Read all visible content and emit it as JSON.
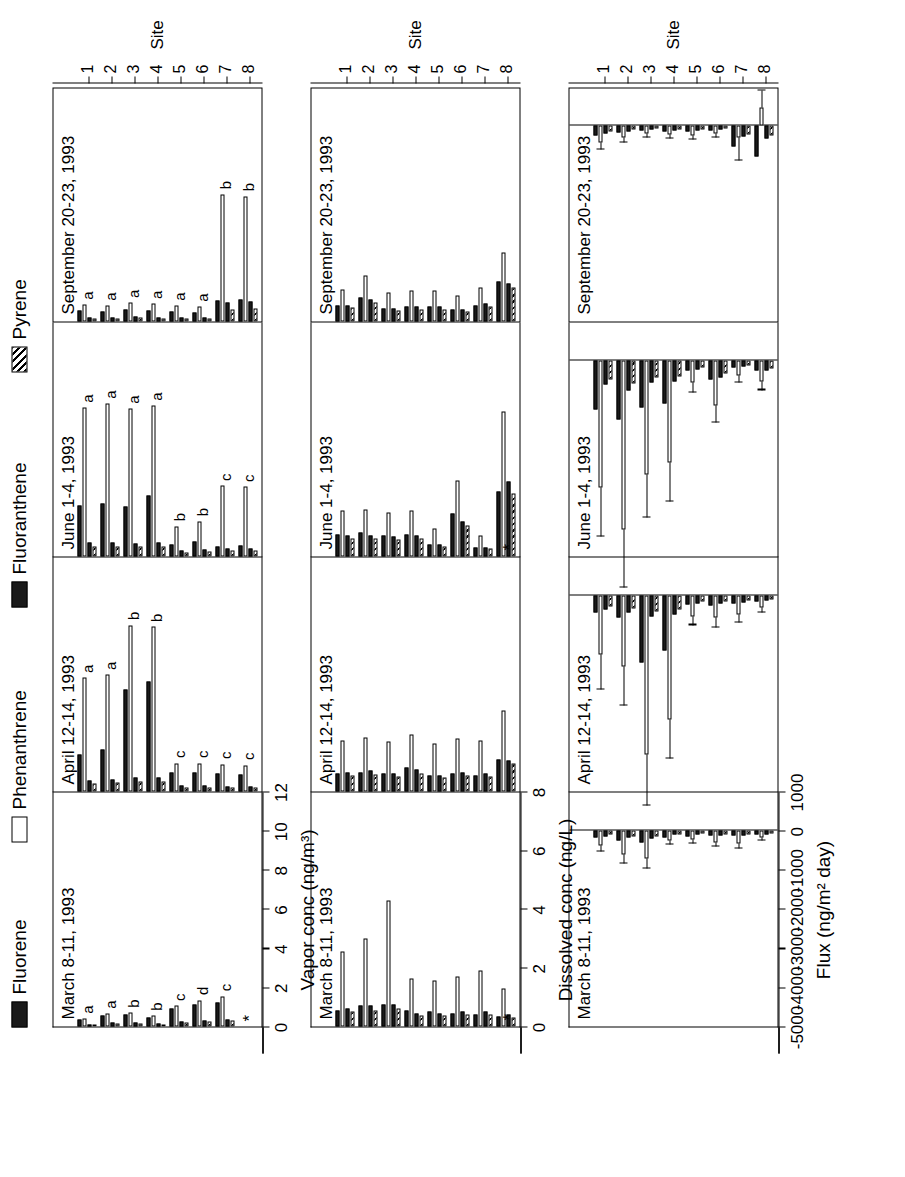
{
  "legend": {
    "items": [
      {
        "label": "Fluorene",
        "swatch": "solid-black"
      },
      {
        "label": "Phenanthrene",
        "swatch": "open-white"
      },
      {
        "label": "Fluoranthene",
        "swatch": "solid-black"
      },
      {
        "label": "Pyrene",
        "swatch": "hatched"
      }
    ]
  },
  "panels": [
    {
      "title": "March 8-11, 1993"
    },
    {
      "title": "April 12-14, 1993"
    },
    {
      "title": "June 1-4, 1993"
    },
    {
      "title": "September 20-23, 1993"
    }
  ],
  "site_axis": {
    "title": "Site",
    "ticks": [
      "1",
      "2",
      "3",
      "4",
      "5",
      "6",
      "7",
      "8"
    ]
  },
  "rows": [
    {
      "id": "vapor",
      "ylabel": "Vapor conc (ng/m³)",
      "yticks": [
        "0",
        "2",
        "4",
        "6",
        "8",
        "10",
        "12"
      ],
      "ymin": 0,
      "ymax": 12
    },
    {
      "id": "dissolved",
      "ylabel": "Dissolved conc (ng/L)",
      "yticks": [
        "0",
        "2",
        "4",
        "6",
        "8"
      ],
      "ymin": 0,
      "ymax": 8
    },
    {
      "id": "flux",
      "ylabel": "Flux (ng/m² day)",
      "yticks": [
        "1000",
        "0",
        "-1000",
        "-2000",
        "-3000",
        "-4000",
        "-5000"
      ],
      "ymin": -5000,
      "ymax": 1000
    }
  ],
  "chart_data": {
    "type": "bar",
    "grid": false,
    "legend_position": "top",
    "series_names": [
      "Fluorene",
      "Phenanthrene",
      "Fluoranthene",
      "Pyrene"
    ],
    "categories": [
      "1",
      "2",
      "3",
      "4",
      "5",
      "6",
      "7",
      "8"
    ],
    "periods": [
      "March 8-11, 1993",
      "April 12-14, 1993",
      "June 1-4, 1993",
      "September 20-23, 1993"
    ],
    "vapor_conc": {
      "ylabel": "Vapor conc (ng/m³)",
      "ylim": [
        0,
        12
      ],
      "units": "ng/m3",
      "data": {
        "March 8-11, 1993": {
          "Fluorene": [
            0.35,
            0.55,
            0.6,
            0.45,
            0.9,
            1.1,
            1.25,
            0.0
          ],
          "Phenanthrene": [
            0.4,
            0.65,
            0.7,
            0.55,
            1.05,
            1.35,
            1.55,
            0.0
          ],
          "Fluoranthene": [
            0.12,
            0.18,
            0.2,
            0.15,
            0.28,
            0.32,
            0.36,
            0.0
          ],
          "Pyrene": [
            0.1,
            0.14,
            0.16,
            0.12,
            0.22,
            0.26,
            0.3,
            0.0
          ]
        },
        "April 12-14, 1993": {
          "Fluorene": [
            1.9,
            2.15,
            5.2,
            5.6,
            0.95,
            0.95,
            0.9,
            0.85
          ],
          "Phenanthrene": [
            5.8,
            5.95,
            8.5,
            8.4,
            1.45,
            1.45,
            1.4,
            1.35
          ],
          "Fluoranthene": [
            0.55,
            0.6,
            0.7,
            0.7,
            0.3,
            0.3,
            0.28,
            0.28
          ],
          "Pyrene": [
            0.42,
            0.46,
            0.52,
            0.52,
            0.22,
            0.22,
            0.21,
            0.21
          ]
        },
        "June 1-4, 1993": {
          "Fluorene": [
            2.6,
            2.7,
            2.55,
            3.1,
            0.6,
            0.75,
            0.5,
            0.55
          ],
          "Phenanthrene": [
            7.6,
            7.8,
            7.55,
            7.7,
            1.55,
            1.8,
            3.6,
            3.55
          ],
          "Fluoranthene": [
            0.7,
            0.72,
            0.68,
            0.72,
            0.3,
            0.34,
            0.42,
            0.4
          ],
          "Pyrene": [
            0.5,
            0.52,
            0.5,
            0.52,
            0.22,
            0.25,
            0.32,
            0.3
          ]
        },
        "September 20-23, 1993": {
          "Fluorene": [
            0.55,
            0.5,
            0.6,
            0.55,
            0.5,
            0.45,
            1.05,
            1.1
          ],
          "Phenanthrene": [
            0.85,
            0.8,
            0.95,
            0.9,
            0.8,
            0.75,
            6.5,
            6.4
          ],
          "Fluoranthene": [
            0.22,
            0.2,
            0.24,
            0.22,
            0.2,
            0.18,
            0.95,
            1.0
          ],
          "Pyrene": [
            0.16,
            0.15,
            0.18,
            0.16,
            0.15,
            0.14,
            0.62,
            0.66
          ]
        }
      },
      "significance_letters": {
        "March 8-11, 1993": [
          "a",
          "a",
          "b",
          "b",
          "c",
          "d",
          "c",
          "*"
        ],
        "April 12-14, 1993": [
          "a",
          "a",
          "b",
          "b",
          "c",
          "c",
          "c",
          "c"
        ],
        "June 1-4, 1993": [
          "a",
          "a",
          "a",
          "a",
          "b",
          "b",
          "c",
          "c"
        ],
        "September 20-23, 1993": [
          "a",
          "a",
          "a",
          "a",
          "a",
          "a",
          "b",
          "b"
        ]
      }
    },
    "dissolved_conc": {
      "ylabel": "Dissolved conc (ng/L)",
      "ylim": [
        0,
        8
      ],
      "units": "ng/L",
      "data": {
        "March 8-11, 1993": {
          "Fluorene": [
            0.55,
            0.7,
            0.75,
            0.55,
            0.5,
            0.45,
            0.4,
            0.35
          ],
          "Phenanthrene": [
            2.55,
            3.0,
            4.3,
            1.65,
            1.55,
            1.7,
            1.9,
            1.3
          ],
          "Fluoranthene": [
            0.6,
            0.7,
            0.75,
            0.45,
            0.45,
            0.5,
            0.5,
            0.4
          ],
          "Pyrene": [
            0.5,
            0.55,
            0.6,
            0.38,
            0.36,
            0.4,
            0.42,
            0.32
          ]
        },
        "April 12-14, 1993": {
          "Fluorene": [
            0.6,
            0.65,
            0.6,
            0.8,
            0.55,
            0.6,
            0.55,
            1.1
          ],
          "Phenanthrene": [
            1.75,
            1.85,
            1.7,
            1.95,
            1.65,
            1.8,
            1.75,
            2.75
          ],
          "Fluoranthene": [
            0.65,
            0.7,
            0.6,
            0.75,
            0.55,
            0.65,
            0.6,
            1.05
          ],
          "Pyrene": [
            0.55,
            0.58,
            0.52,
            0.62,
            0.46,
            0.55,
            0.5,
            0.95
          ]
        },
        "June 1-4, 1993": {
          "Fluorene": [
            0.75,
            0.8,
            0.7,
            0.75,
            0.4,
            1.45,
            0.3,
            2.2
          ],
          "Phenanthrene": [
            1.55,
            1.6,
            1.5,
            1.55,
            0.95,
            2.6,
            0.7,
            4.95
          ],
          "Fluoranthene": [
            0.7,
            0.72,
            0.68,
            0.7,
            0.4,
            1.2,
            0.3,
            2.55
          ],
          "Pyrene": [
            0.6,
            0.62,
            0.58,
            0.6,
            0.34,
            1.05,
            0.26,
            2.15
          ]
        },
        "September 20-23, 1993": {
          "Fluorene": [
            0.55,
            0.8,
            0.45,
            0.5,
            0.5,
            0.4,
            0.55,
            1.35
          ],
          "Phenanthrene": [
            1.1,
            1.55,
            1.0,
            1.05,
            1.05,
            0.9,
            1.15,
            2.35
          ],
          "Fluoranthene": [
            0.55,
            0.75,
            0.45,
            0.5,
            0.5,
            0.4,
            0.6,
            1.3
          ],
          "Pyrene": [
            0.48,
            0.65,
            0.38,
            0.42,
            0.42,
            0.34,
            0.52,
            1.15
          ]
        }
      },
      "annotations": {
        "March 8-11, 1993": "*",
        "June 1-4, 1993": "*"
      }
    },
    "flux": {
      "ylabel": "Flux (ng/m² day)",
      "ylim": [
        -5000,
        1000
      ],
      "units": "ng/m2 day",
      "note": "Negative flux = net deposition into water; error bars are ±1 standard deviation",
      "data": {
        "March 8-11, 1993": {
          "Fluorene": [
            -180,
            -260,
            -300,
            -170,
            -150,
            -130,
            -120,
            -90
          ],
          "Phenanthrene": [
            -380,
            -620,
            -700,
            -250,
            -230,
            -290,
            -320,
            -180
          ],
          "Fluoranthene": [
            -140,
            -180,
            -200,
            -110,
            -100,
            -120,
            -120,
            -90
          ],
          "Pyrene": [
            -110,
            -140,
            -160,
            -90,
            -85,
            -100,
            -100,
            -70
          ]
        },
        "April 12-14, 1993": {
          "Fluorene": [
            -420,
            -560,
            -1700,
            -1400,
            -230,
            -250,
            -210,
            -150
          ],
          "Phenanthrene": [
            -1500,
            -1800,
            -4050,
            -3150,
            -520,
            -560,
            -480,
            -300
          ],
          "Fluoranthene": [
            -360,
            -430,
            -520,
            -470,
            -190,
            -200,
            -170,
            -120
          ],
          "Pyrene": [
            -280,
            -330,
            -400,
            -360,
            -150,
            -160,
            -135,
            -95
          ]
        },
        "June 1-4, 1993": {
          "Fluorene": [
            -1250,
            -1500,
            -1200,
            -1100,
            -260,
            -480,
            -180,
            -260
          ],
          "Phenanthrene": [
            -3250,
            -4300,
            -2900,
            -2600,
            -560,
            -1150,
            -380,
            -520
          ],
          "Fluoranthene": [
            -620,
            -760,
            -560,
            -520,
            -230,
            -420,
            -160,
            -260
          ],
          "Pyrene": [
            -480,
            -580,
            -430,
            -400,
            -180,
            -330,
            -125,
            -200
          ]
        },
        "September 20-23, 1993": {
          "Fluorene": [
            -240,
            -170,
            -130,
            -140,
            -150,
            -130,
            -520,
            -800
          ],
          "Phenanthrene": [
            -430,
            -300,
            -210,
            -230,
            -240,
            -210,
            -300,
            470
          ],
          "Fluoranthene": [
            -190,
            -140,
            -110,
            -115,
            -120,
            -110,
            -280,
            -330
          ],
          "Pyrene": [
            -150,
            -110,
            -85,
            -90,
            -95,
            -85,
            -220,
            -260
          ]
        }
      },
      "error_bars": {
        "March 8-11, 1993": {
          "Phenanthrene": [
            160,
            230,
            260,
            110,
            100,
            120,
            140,
            80
          ]
        },
        "April 12-14, 1993": {
          "Phenanthrene": [
            900,
            1000,
            1300,
            1000,
            230,
            250,
            210,
            140
          ]
        },
        "June 1-4, 1993": {
          "Phenanthrene": [
            1250,
            1500,
            1100,
            1000,
            250,
            430,
            170,
            230
          ]
        },
        "September 20-23, 1993": {
          "Phenanthrene": [
            190,
            140,
            95,
            100,
            105,
            95,
            600,
            430
          ]
        }
      }
    }
  }
}
